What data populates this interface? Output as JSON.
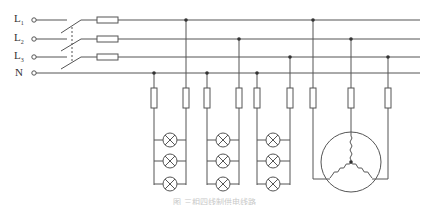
{
  "diagram": {
    "supply_lines": [
      {
        "id": "L1",
        "label": "L",
        "subscript": "1",
        "y": 20
      },
      {
        "id": "L2",
        "label": "L",
        "subscript": "2",
        "y": 39
      },
      {
        "id": "L3",
        "label": "L",
        "subscript": "3",
        "y": 57
      },
      {
        "id": "N",
        "label": "N",
        "subscript": "",
        "y": 73
      }
    ],
    "main_switch": {
      "type": "three-pole switch",
      "poles": 3
    },
    "main_fuses": 3,
    "lighting_groups": [
      {
        "phase": "L1",
        "neutral_x": 154,
        "phase_x": 186,
        "lamps": 3
      },
      {
        "phase": "L2",
        "neutral_x": 207,
        "phase_x": 239,
        "lamps": 3
      },
      {
        "phase": "L3",
        "neutral_x": 257,
        "phase_x": 290,
        "lamps": 3
      }
    ],
    "motor": {
      "type": "three-phase star-connected motor",
      "connections": [
        "L1",
        "L2",
        "L3"
      ]
    },
    "caption": "图 三相四线制供电线路"
  },
  "colors": {
    "line": "#555555",
    "text": "#333333",
    "caption": "#c8c8c8"
  }
}
